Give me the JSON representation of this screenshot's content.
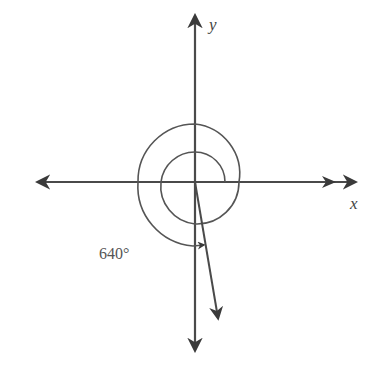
{
  "diagram": {
    "type": "coordinate-angle-diagram",
    "axes": {
      "x_label": "x",
      "y_label": "y"
    },
    "angle": {
      "label": "640°",
      "degrees": 640,
      "terminal_ray_direction_deg": 280
    },
    "colors": {
      "stroke": "#4a4a4a",
      "background": "#ffffff"
    }
  }
}
